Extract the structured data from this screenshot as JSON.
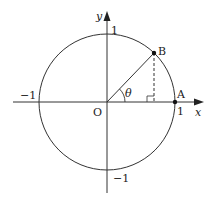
{
  "diagram": {
    "colors": {
      "stroke": "#333333",
      "background": "#ffffff"
    },
    "axes": {
      "x_label": "x",
      "y_label": "y"
    },
    "ticks": {
      "x_pos": "1",
      "x_neg": "−1",
      "y_pos": "1",
      "y_neg": "−1"
    },
    "points": {
      "origin": "O",
      "A": "A",
      "B": "B"
    },
    "angle_label": "θ"
  }
}
